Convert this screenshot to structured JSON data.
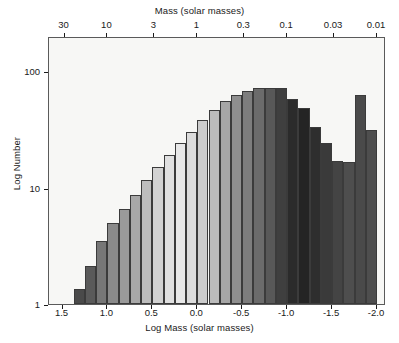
{
  "chart_data": {
    "type": "bar",
    "title": "",
    "subtitle": "",
    "xlabel": "Log Mass (solar masses)",
    "ylabel": "Log Number",
    "top_axis_label": "Mass (solar masses)",
    "grid": false,
    "legend": "none",
    "yscale": "log",
    "ylim": [
      1,
      200
    ],
    "yticks": [
      1,
      10,
      100
    ],
    "ytick_labels": [
      "1",
      "10",
      "100"
    ],
    "xlim": [
      1.65,
      -2.1
    ],
    "x_reversed": true,
    "xticks": [
      1.5,
      1.0,
      0.5,
      0.0,
      -0.5,
      -1.0,
      -1.5,
      -2.0
    ],
    "xtick_labels": [
      "1.5",
      "1.0",
      "0.5",
      "0.0",
      "-0.5",
      "-1.0",
      "-1.5",
      "-2.0"
    ],
    "top_xticks": [
      1.4771,
      1.0,
      0.4771,
      0.0,
      -0.5229,
      -1.0,
      -1.5229,
      -2.0
    ],
    "top_xtick_labels": [
      "30",
      "10",
      "3",
      "1",
      "0.3",
      "0.1",
      "0.03",
      "0.01"
    ],
    "bin_width": 0.125,
    "x": [
      1.3125,
      1.1875,
      1.0625,
      0.9375,
      0.8125,
      0.6875,
      0.5625,
      0.4375,
      0.3125,
      0.1875,
      0.0625,
      -0.0625,
      -0.1875,
      -0.3125,
      -0.4375,
      -0.5625,
      -0.6875,
      -0.8125,
      -0.9375,
      -1.0625,
      -1.1875,
      -1.3125,
      -1.4375,
      -1.5625,
      -1.6875,
      -1.8125,
      -1.9375
    ],
    "categories": [
      "1.31",
      "1.19",
      "1.06",
      "0.94",
      "0.81",
      "0.69",
      "0.56",
      "0.44",
      "0.31",
      "0.19",
      "0.06",
      "-0.06",
      "-0.19",
      "-0.31",
      "-0.44",
      "-0.56",
      "-0.69",
      "-0.81",
      "-0.94",
      "-1.06",
      "-1.19",
      "-1.31",
      "-1.44",
      "-1.56",
      "-1.69",
      "-1.81",
      "-1.94"
    ],
    "values": [
      1.35,
      2.1,
      3.5,
      5.0,
      6.6,
      8.6,
      11.5,
      15.0,
      19.0,
      24.0,
      30.0,
      38.0,
      46.0,
      55.0,
      62.0,
      68.0,
      72.0,
      72.0,
      72.0,
      58.0,
      48.0,
      33.0,
      24.0,
      17.0,
      16.5,
      62.0,
      31.0
    ],
    "bar_colors": [
      "#4a4a4a",
      "#5a5a5a",
      "#777777",
      "#8a8a8a",
      "#9a9a9a",
      "#a8a8a8",
      "#bdbdbd",
      "#d2d2d2",
      "#e0e0e0",
      "#e8e8e8",
      "#dcdcdc",
      "#cccccc",
      "#bbbbbb",
      "#a6a6a6",
      "#8f8f8f",
      "#7d7d7d",
      "#6b6b6b",
      "#585858",
      "#3f3f3f",
      "#2b2b2b",
      "#242424",
      "#2e2e2e",
      "#3a3a3a",
      "#444444",
      "#4e4e4e",
      "#4a4a4a",
      "#4e4e4e"
    ],
    "axis_color": "#5a5a5a",
    "plot_bg": "#f7f7f5",
    "bar_edge_color": "#3b3b3b"
  }
}
